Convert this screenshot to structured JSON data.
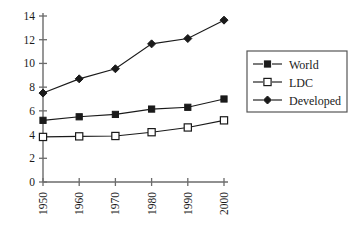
{
  "chart_data": {
    "type": "line",
    "title": "",
    "xlabel": "",
    "ylabel": "",
    "categories": [
      "1950",
      "1960",
      "1970",
      "1980",
      "1990",
      "2000"
    ],
    "x": [
      1950,
      1960,
      1970,
      1980,
      1990,
      2000
    ],
    "ylim": [
      0,
      14
    ],
    "yticks": [
      0,
      2,
      4,
      6,
      8,
      10,
      12,
      14
    ],
    "ytick_labels": [
      "0",
      "2",
      "4",
      "6",
      "8",
      "10",
      "12",
      "14"
    ],
    "xtick_labels": [
      "1950",
      "1960",
      "1970",
      "1980",
      "1990",
      "2000"
    ],
    "xtick_rotation": -90,
    "grid": false,
    "legend_position": "right",
    "series": [
      {
        "name": "World",
        "marker": "filled-square",
        "color": "#1a1a1a",
        "values": [
          5.2,
          5.5,
          5.7,
          6.15,
          6.3,
          7.0
        ]
      },
      {
        "name": "LDC",
        "marker": "open-square",
        "color": "#1a1a1a",
        "values": [
          3.8,
          3.85,
          3.88,
          4.2,
          4.6,
          5.2
        ]
      },
      {
        "name": "Developed",
        "marker": "filled-diamond",
        "color": "#1a1a1a",
        "values": [
          7.5,
          8.7,
          9.55,
          11.65,
          12.1,
          13.65
        ]
      }
    ]
  },
  "legend": {
    "entries": [
      {
        "label": "World",
        "marker": "filled-square"
      },
      {
        "label": "LDC",
        "marker": "open-square"
      },
      {
        "label": "Developed",
        "marker": "filled-diamond"
      }
    ]
  }
}
